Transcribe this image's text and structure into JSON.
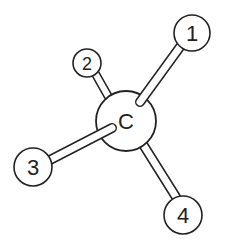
{
  "diagram": {
    "type": "molecule-ball-and-stick",
    "center_atom": {
      "label": "C",
      "x": 126,
      "y": 121,
      "r": 30
    },
    "substituents": [
      {
        "label": "1",
        "x": 192,
        "y": 33,
        "r": 18,
        "bond_in_front": true
      },
      {
        "label": "2",
        "x": 87,
        "y": 63,
        "r": 14,
        "bond_in_front": false
      },
      {
        "label": "3",
        "x": 33,
        "y": 167,
        "r": 19,
        "bond_in_front": true
      },
      {
        "label": "4",
        "x": 183,
        "y": 215,
        "r": 19,
        "bond_in_front": false
      }
    ],
    "colors": {
      "stroke": "#222222",
      "fill": "#ffffff"
    }
  }
}
